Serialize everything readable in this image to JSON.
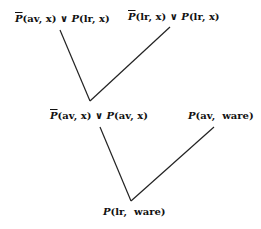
{
  "diagram": {
    "type": "resolution-tree",
    "nodes": [
      {
        "id": "c1",
        "label": "P̄(av, x) ∨ P(lr, x)",
        "parts": {
          "neg": "P",
          "a": "(av, x) ∨ ",
          "pos": "P",
          "b": "(lr, x)"
        }
      },
      {
        "id": "c2",
        "label": "P̄(lr, x) ∨ P(lr, x)",
        "parts": {
          "neg": "P",
          "a": "(lr, x) ∨ ",
          "pos": "P",
          "b": "(lr, x)"
        }
      },
      {
        "id": "c3",
        "label": "P̄(av, x) ∨ P(av, x)",
        "parts": {
          "neg": "P",
          "a": "(av, x) ∨ ",
          "pos": "P",
          "b": "(av, x)"
        }
      },
      {
        "id": "c4",
        "label": "P(av, ware)",
        "parts": {
          "pos": "P",
          "b": "(av,  ware)"
        }
      },
      {
        "id": "c5",
        "label": "P(lr, ware)",
        "parts": {
          "pos": "P",
          "b": "(lr,  ware)"
        }
      }
    ],
    "edges": [
      {
        "from": "c1",
        "to": "c3"
      },
      {
        "from": "c2",
        "to": "c3"
      },
      {
        "from": "c3",
        "to": "c5"
      },
      {
        "from": "c4",
        "to": "c5"
      }
    ]
  }
}
